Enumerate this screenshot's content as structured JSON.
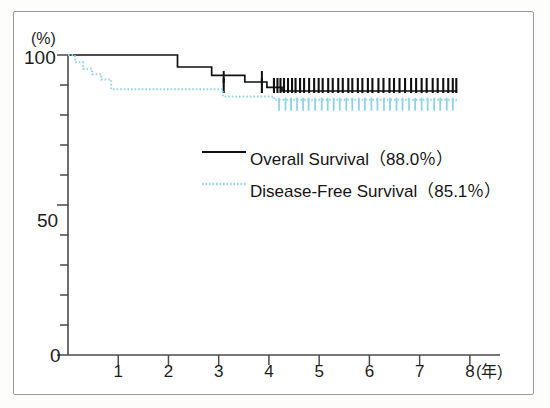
{
  "figure": {
    "name": "kaplan-meier-survival-plot"
  },
  "axes": {
    "y_unit_label": "(%)",
    "y_ticks_major": [
      {
        "value": 100,
        "label": "100"
      },
      {
        "value": 50,
        "label": "50"
      },
      {
        "value": 0,
        "label": "0"
      }
    ],
    "y_ticks_minor": [
      10,
      20,
      30,
      40,
      60,
      70,
      80,
      90
    ],
    "x_unit_label": "(年)",
    "x_ticks": [
      {
        "value": 0,
        "label": ""
      },
      {
        "value": 1,
        "label": "1"
      },
      {
        "value": 2,
        "label": "2"
      },
      {
        "value": 3,
        "label": "3"
      },
      {
        "value": 4,
        "label": "4"
      },
      {
        "value": 5,
        "label": "5"
      },
      {
        "value": 6,
        "label": "6"
      },
      {
        "value": 7,
        "label": "7"
      },
      {
        "value": 8,
        "label": "8"
      }
    ]
  },
  "legend": {
    "items": [
      {
        "label": "Overall Survival（88.0％）",
        "style": "solid",
        "color": "#111111"
      },
      {
        "label": "Disease-Free Survival（85.1％）",
        "style": "dotted",
        "color": "#8fd2e8"
      }
    ]
  },
  "chart_data": {
    "type": "line",
    "title": "",
    "xlabel": "(年)",
    "ylabel": "(%)",
    "xlim": [
      0,
      8.6
    ],
    "ylim": [
      0,
      100
    ],
    "grid": false,
    "legend_position": "center",
    "x_ticks": [
      0,
      1,
      2,
      3,
      4,
      5,
      6,
      7,
      8
    ],
    "y_ticks": [
      0,
      10,
      20,
      30,
      40,
      50,
      60,
      70,
      80,
      90,
      100
    ],
    "series": [
      {
        "name": "Overall Survival（88.0％）",
        "final_value": 88.0,
        "color": "#111111",
        "style": "solid",
        "steps": [
          {
            "x": 0.0,
            "y": 100.0
          },
          {
            "x": 2.18,
            "y": 100.0
          },
          {
            "x": 2.18,
            "y": 96.0
          },
          {
            "x": 2.86,
            "y": 96.0
          },
          {
            "x": 2.86,
            "y": 93.2
          },
          {
            "x": 3.52,
            "y": 93.2
          },
          {
            "x": 3.52,
            "y": 91.0
          },
          {
            "x": 3.96,
            "y": 91.0
          },
          {
            "x": 3.96,
            "y": 89.2
          },
          {
            "x": 4.26,
            "y": 89.2
          },
          {
            "x": 4.26,
            "y": 88.0
          },
          {
            "x": 7.75,
            "y": 88.0
          }
        ],
        "censor_marks": [
          3.1,
          3.86,
          4.1,
          4.17,
          4.23,
          4.3,
          4.38,
          4.46,
          4.53,
          4.62,
          4.7,
          4.8,
          4.9,
          4.99,
          5.07,
          5.18,
          5.27,
          5.38,
          5.47,
          5.58,
          5.66,
          5.77,
          5.86,
          5.97,
          6.06,
          6.18,
          6.28,
          6.4,
          6.49,
          6.6,
          6.71,
          6.83,
          6.93,
          7.04,
          7.14,
          7.26,
          7.36,
          7.47,
          7.57,
          7.66,
          7.73
        ]
      },
      {
        "name": "Disease-Free Survival（85.1％）",
        "final_value": 85.1,
        "color": "#8fd2e8",
        "style": "dotted",
        "steps": [
          {
            "x": 0.0,
            "y": 100.0
          },
          {
            "x": 0.14,
            "y": 100.0
          },
          {
            "x": 0.14,
            "y": 97.6
          },
          {
            "x": 0.3,
            "y": 97.6
          },
          {
            "x": 0.3,
            "y": 95.4
          },
          {
            "x": 0.48,
            "y": 95.4
          },
          {
            "x": 0.48,
            "y": 93.6
          },
          {
            "x": 0.66,
            "y": 93.6
          },
          {
            "x": 0.66,
            "y": 91.8
          },
          {
            "x": 0.86,
            "y": 91.8
          },
          {
            "x": 0.86,
            "y": 88.6
          },
          {
            "x": 3.08,
            "y": 88.6
          },
          {
            "x": 3.08,
            "y": 86.2
          },
          {
            "x": 4.1,
            "y": 86.2
          },
          {
            "x": 4.1,
            "y": 85.1
          },
          {
            "x": 7.75,
            "y": 85.1
          }
        ],
        "censor_marks": [
          4.2,
          4.33,
          4.44,
          4.56,
          4.68,
          4.79,
          4.92,
          5.05,
          5.17,
          5.29,
          5.41,
          5.54,
          5.66,
          5.79,
          5.91,
          6.04,
          6.16,
          6.29,
          6.41,
          6.54,
          6.66,
          6.79,
          6.91,
          7.04,
          7.16,
          7.29,
          7.41,
          7.54,
          7.66
        ]
      }
    ]
  },
  "colors": {
    "frame": "#9a9a9a",
    "axis": "#4a4a4a",
    "overall_survival": "#111111",
    "disease_free_survival": "#8fd2e8",
    "background": "#ffffff"
  }
}
